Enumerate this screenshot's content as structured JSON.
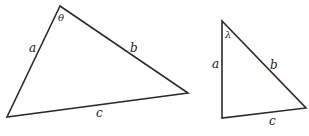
{
  "diagram": {
    "stroke_color": "#2a2a2a",
    "triangles": [
      {
        "id": "triangle-1",
        "vertices": {
          "top": [
            60,
            6
          ],
          "bottom_left": [
            7,
            117
          ],
          "right": [
            188,
            93
          ]
        },
        "angle_label": "θ",
        "side_labels": {
          "a": "a",
          "b": "b",
          "c": "c"
        }
      },
      {
        "id": "triangle-2",
        "vertices": {
          "top": [
            222,
            21
          ],
          "bottom_left": [
            222,
            118
          ],
          "bottom_right": [
            306,
            108
          ]
        },
        "angle_label": "λ",
        "side_labels": {
          "a": "a",
          "b": "b",
          "c": "c"
        }
      }
    ]
  }
}
